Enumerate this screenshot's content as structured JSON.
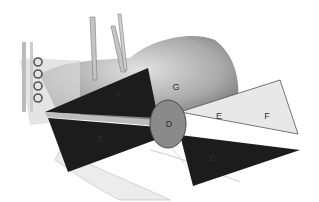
{
  "figure": {
    "type": "anatomical-diagram",
    "labels": {
      "A": {
        "text": "A",
        "x": 118,
        "y": 95
      },
      "B": {
        "text": "B",
        "x": 100,
        "y": 139
      },
      "C": {
        "text": "C",
        "x": 213,
        "y": 158
      },
      "D": {
        "text": "D",
        "x": 169,
        "y": 124
      },
      "E": {
        "text": "E",
        "x": 219,
        "y": 116
      },
      "F": {
        "text": "F",
        "x": 267,
        "y": 116
      },
      "G": {
        "text": "G",
        "x": 176,
        "y": 87
      }
    },
    "colors": {
      "dark_zone": "#1c1c1c",
      "light_zone": "#e6e6e6",
      "center_oval": "#8a8a8a",
      "tissue": "#c8c8c8",
      "outline": "#555555"
    }
  }
}
